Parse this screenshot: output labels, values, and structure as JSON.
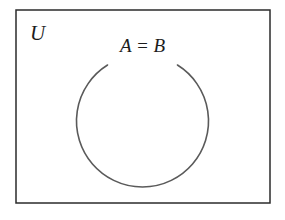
{
  "diagram": {
    "type": "venn-diagram",
    "background_color": "#ffffff",
    "universe": {
      "label": "U",
      "shape": "rectangle",
      "border_color": "#2b2b2b",
      "fill_color": "#ffffff",
      "border_width": 1.5,
      "x": 16,
      "y": 10,
      "width": 254,
      "height": 193,
      "label_x": 30,
      "label_y": 40
    },
    "sets": [
      {
        "label": "A = B",
        "shape": "circle",
        "stroke_color": "#5a5a5a",
        "fill_color": "none",
        "stroke_width": 1.6,
        "center_x": 142.5,
        "center_y": 121,
        "radius": 66,
        "gap_start_deg": -122,
        "gap_end_deg": -58,
        "label_x": 142.5,
        "label_y": 52
      }
    ]
  }
}
